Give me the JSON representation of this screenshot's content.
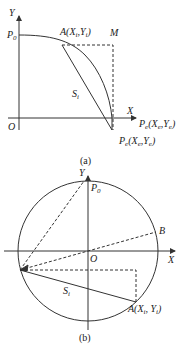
{
  "panel_a": {
    "axis_y": "Y",
    "axis_x": "X",
    "origin": "O",
    "p0": "P",
    "p0_sub": "0",
    "point_a": "A(X",
    "point_a_sub1": "i",
    "point_a_mid": ",Y",
    "point_a_sub2": "i",
    "point_a_end": ")",
    "point_m": "M",
    "area": "S",
    "area_sub": "i",
    "pe_label_1": "P",
    "pe_label_1_sub": "e",
    "pe_label_1_rest": "(X",
    "pe_label_1_sub2": "e",
    "pe_label_1_mid": ",Y",
    "pe_label_1_sub3": "e",
    "pe_label_1_end": ")",
    "pe_label_2": "P",
    "pe_label_2_sub": "e",
    "pe_label_2_rest": "(X",
    "pe_label_2_sub2": "e",
    "pe_label_2_mid": ",Y",
    "pe_label_2_sub3": "e",
    "pe_label_2_end": ")",
    "caption": "(a)"
  },
  "panel_b": {
    "axis_y": "Y",
    "axis_x": "X",
    "origin": "O",
    "p0": "P",
    "p0_sub": "0",
    "point_b": "B",
    "area": "S",
    "area_sub": "i",
    "point_a": "A(X",
    "point_a_sub1": "i",
    "point_a_mid": ", Y",
    "point_a_sub2": "i",
    "point_a_end": ")",
    "caption": "(b)"
  },
  "colors": {
    "line": "#333333",
    "background": "#ffffff"
  }
}
